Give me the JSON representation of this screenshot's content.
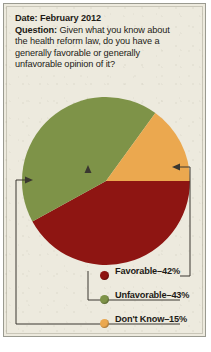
{
  "card": {
    "date_label": "Date:",
    "date_value": "February 2012",
    "date_line": "Date: February 2012",
    "question_label": "Question:",
    "question_lines": [
      "Question: Given what you know about",
      "the health reform law, do you have a",
      "generally favorable or generally",
      "unfavorable opinion of it?"
    ],
    "question_full": "Question: Given what you know about the health reform law, do you have a generally favorable or generally unfavorable opinion of it?",
    "background_color": "#edeade",
    "border_color": "#9a9a90"
  },
  "chart_data": {
    "type": "pie",
    "title": "",
    "categories": [
      "Favorable",
      "Unfavorable",
      "Don't Know"
    ],
    "values": [
      42,
      43,
      15
    ],
    "value_labels": [
      "42%",
      "43%",
      "15%"
    ],
    "colors": [
      "#8e1512",
      "#7e9348",
      "#eba84f"
    ],
    "units": "percent",
    "legend_position": "bottom",
    "grid": false,
    "leader_lines": true,
    "slices": [
      {
        "label": "Favorable",
        "value": 42,
        "value_label": "42%",
        "color": "#8e1512",
        "start_deg": 0,
        "end_deg": 151.2
      },
      {
        "label": "Unfavorable",
        "value": 43,
        "value_label": "43%",
        "color": "#7e9348",
        "start_deg": 151.2,
        "end_deg": 306.0
      },
      {
        "label": "Don't Know",
        "value": 15,
        "value_label": "15%",
        "color": "#eba84f",
        "start_deg": 306.0,
        "end_deg": 360.0
      }
    ]
  },
  "legend": {
    "items": [
      {
        "label": "Favorable–42%",
        "color": "#8e1512"
      },
      {
        "label": "Unfavorable–43%",
        "color": "#7e9348"
      },
      {
        "label": "Don't Know–15%",
        "color": "#eba84f"
      }
    ]
  }
}
